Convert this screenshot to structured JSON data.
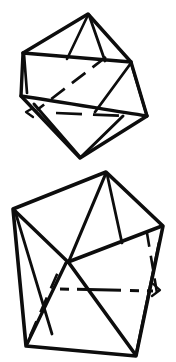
{
  "image": {
    "title": "Two hand-drawn polyhedron line drawings",
    "background_color": "#ffffff",
    "ink_color": "#0d0d0d",
    "width": 176,
    "height": 362,
    "style": "hand-drawn ink line art, solid visible edges, dashed hidden edges",
    "figure_count": 2
  },
  "figures": [
    {
      "name": "upper-polyhedron",
      "label": "Icosahedron-like solid, upper figure",
      "bounds": {
        "x": 18,
        "y": 10,
        "width": 134,
        "height": 152
      },
      "vertices": {
        "top_apex": [
          88,
          14
        ],
        "upper_left": [
          23,
          53
        ],
        "upper_right": [
          131,
          62
        ],
        "mid_left": [
          25,
          97
        ],
        "far_right": [
          147,
          116
        ],
        "bottom_apex": [
          80,
          158
        ],
        "lower_left": [
          33,
          112
        ]
      },
      "visible_edges": [
        [
          [
            88,
            14
          ],
          [
            23,
            53
          ]
        ],
        [
          [
            88,
            14
          ],
          [
            131,
            62
          ]
        ],
        [
          [
            23,
            53
          ],
          [
            131,
            62
          ]
        ],
        [
          [
            23,
            53
          ],
          [
            21,
            96
          ]
        ],
        [
          [
            131,
            62
          ],
          [
            147,
            116
          ]
        ],
        [
          [
            21,
            96
          ],
          [
            80,
            158
          ]
        ],
        [
          [
            147,
            116
          ],
          [
            80,
            158
          ]
        ],
        [
          [
            88,
            14
          ],
          [
            68,
            60
          ]
        ],
        [
          [
            88,
            14
          ],
          [
            104,
            62
          ]
        ],
        [
          [
            23,
            53
          ],
          [
            80,
            158
          ]
        ],
        [
          [
            131,
            62
          ],
          [
            80,
            158
          ]
        ],
        [
          [
            131,
            62
          ],
          [
            34,
            112
          ]
        ],
        [
          [
            21,
            96
          ],
          [
            147,
            116
          ]
        ],
        [
          [
            131,
            62
          ],
          [
            95,
            110
          ]
        ]
      ],
      "hidden_edges": [
        [
          [
            106,
            56
          ],
          [
            37,
            108
          ]
        ],
        [
          [
            58,
            113
          ],
          [
            125,
            116
          ]
        ]
      ],
      "stroke_width": 3.1
    },
    {
      "name": "lower-polyhedron",
      "label": "Pentagonal bipyramid-like solid, lower figure",
      "bounds": {
        "x": 10,
        "y": 168,
        "width": 156,
        "height": 192
      },
      "vertices": {
        "top_apex": [
          106,
          172
        ],
        "left": [
          13,
          209
        ],
        "right": [
          163,
          226
        ],
        "bottom_left": [
          26,
          346
        ],
        "bottom_right": [
          136,
          356
        ],
        "center_node": [
          68,
          262
        ]
      },
      "visible_edges": [
        [
          [
            106,
            172
          ],
          [
            13,
            209
          ]
        ],
        [
          [
            106,
            172
          ],
          [
            163,
            226
          ]
        ],
        [
          [
            13,
            209
          ],
          [
            26,
            346
          ]
        ],
        [
          [
            163,
            226
          ],
          [
            136,
            356
          ]
        ],
        [
          [
            26,
            346
          ],
          [
            136,
            356
          ]
        ],
        [
          [
            106,
            172
          ],
          [
            68,
            262
          ]
        ],
        [
          [
            13,
            209
          ],
          [
            68,
            262
          ]
        ],
        [
          [
            68,
            262
          ],
          [
            163,
            226
          ]
        ],
        [
          [
            68,
            262
          ],
          [
            26,
            346
          ]
        ],
        [
          [
            68,
            262
          ],
          [
            136,
            356
          ]
        ],
        [
          [
            13,
            209
          ],
          [
            50,
            330
          ]
        ],
        [
          [
            106,
            172
          ],
          [
            120,
            240
          ]
        ],
        [
          [
            136,
            356
          ],
          [
            160,
            240
          ]
        ]
      ],
      "hidden_edges": [
        [
          [
            62,
            289
          ],
          [
            155,
            291
          ]
        ],
        [
          [
            148,
            234
          ],
          [
            159,
            300
          ]
        ],
        [
          [
            26,
            346
          ],
          [
            57,
            270
          ]
        ]
      ],
      "stroke_width": 3.4
    }
  ]
}
